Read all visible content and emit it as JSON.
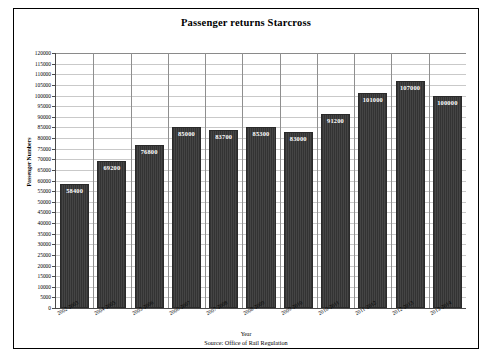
{
  "chart_data": {
    "type": "bar",
    "title": "Passenger returns Starcross",
    "xlabel": "Year",
    "ylabel": "Passenger Numbers",
    "source": "Source: Office of Rail Regulation",
    "categories": [
      "2002-2003",
      "2004-2005",
      "2005-2006",
      "2006-2007",
      "2007-2008",
      "2008-2009",
      "2009-2010",
      "2010-2011",
      "2011-2012",
      "2012-2013",
      "2013-2014"
    ],
    "values": [
      58400,
      69200,
      76800,
      85000,
      83700,
      85300,
      83000,
      91200,
      101000,
      107000,
      100000
    ],
    "value_labels": [
      "58400",
      "69200",
      "76800",
      "85000",
      "83700",
      "85300",
      "83000",
      "91200",
      "101000",
      "107000",
      "100000"
    ],
    "ylim": [
      0,
      120000
    ],
    "ytick_step": 5000,
    "ytick_labels": [
      "120000",
      "115000",
      "110000",
      "105000",
      "100000",
      "95000",
      "90000",
      "85000",
      "80000",
      "75000",
      "70000",
      "65000",
      "60000",
      "55000",
      "50000",
      "45000",
      "40000",
      "35000",
      "30000",
      "25000",
      "20000",
      "15000",
      "10000",
      "5000",
      "0"
    ],
    "grid": true,
    "legend": "none",
    "bar_color": "#3b3b3b",
    "gridline_color": "#c9c9c9",
    "axis_color": "#4a4a4a"
  }
}
